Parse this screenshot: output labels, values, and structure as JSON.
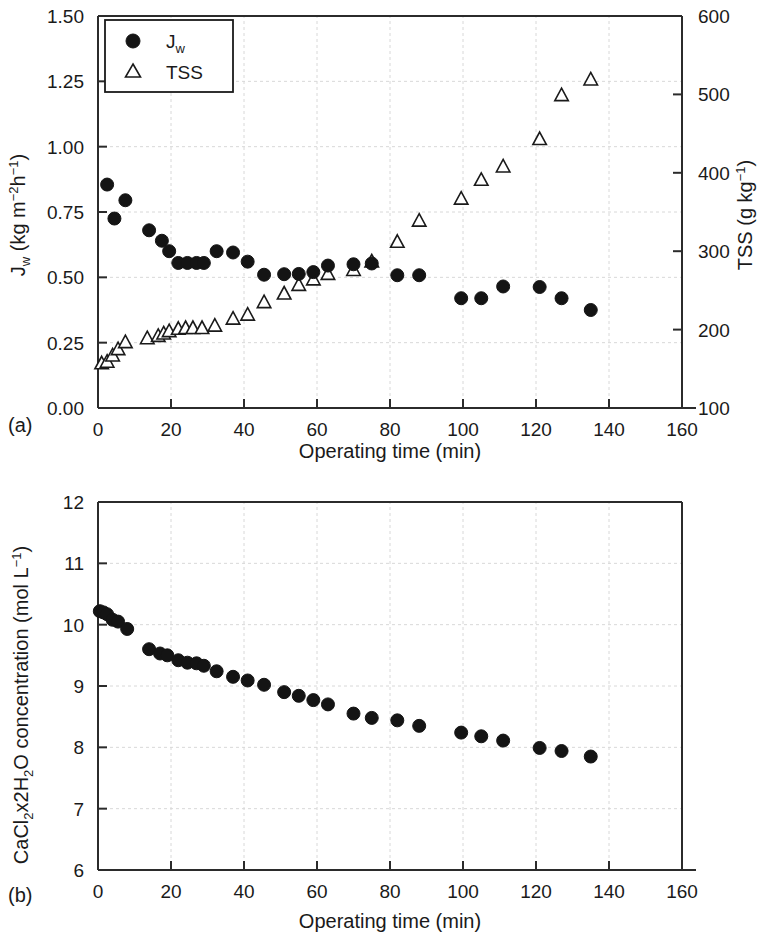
{
  "figure": {
    "panel_a_label": "(a)",
    "panel_b_label": "(b)"
  },
  "chart_data": [
    {
      "id": "panel_a",
      "type": "scatter",
      "title": "",
      "xlabel": "Operating time (min)",
      "ylabel": "J_w (kg m^-2 h^-1)",
      "ylabel_parts": {
        "prefix": "J",
        "sub": "w",
        "unit_open": " (kg m",
        "unit_sup1": "-2",
        "unit_mid": "h",
        "unit_sup2": "-1",
        "unit_close": ")"
      },
      "y2label": "TSS (g kg^-1)",
      "y2label_parts": {
        "prefix": "TSS (g kg",
        "sup": "-1",
        "close": ")"
      },
      "xlim": [
        0,
        160
      ],
      "ylim": [
        0.0,
        1.5
      ],
      "y2lim": [
        100,
        600
      ],
      "xticks": [
        0,
        20,
        40,
        60,
        80,
        100,
        120,
        140,
        160
      ],
      "xtick_labels": [
        "0",
        "20",
        "40",
        "60",
        "80",
        "100",
        "120",
        "140",
        "160"
      ],
      "yticks": [
        0.0,
        0.25,
        0.5,
        0.75,
        1.0,
        1.25,
        1.5
      ],
      "ytick_labels": [
        "0.00",
        "0.25",
        "0.50",
        "0.75",
        "1.00",
        "1.25",
        "1.50"
      ],
      "y2ticks": [
        100,
        200,
        300,
        400,
        500,
        600
      ],
      "y2tick_labels": [
        "100",
        "200",
        "300",
        "400",
        "500",
        "600"
      ],
      "grid": true,
      "legend_position": "top-left",
      "series": [
        {
          "name": "Jw",
          "label_prefix": "J",
          "label_sub": "w",
          "marker": "filled-circle",
          "color": "#141414",
          "axis": "left",
          "x": [
            2.5,
            4.5,
            7.5,
            14.0,
            17.5,
            19.5,
            22.0,
            24.5,
            27.0,
            29.0,
            32.5,
            37.0,
            41.0,
            45.5,
            51.0,
            55.0,
            59.0,
            63.0,
            70.0,
            75.0,
            82.0,
            88.0,
            99.5,
            105.0,
            111.0,
            121.0,
            127.0,
            135.0
          ],
          "y": [
            0.855,
            0.725,
            0.795,
            0.68,
            0.64,
            0.6,
            0.555,
            0.555,
            0.555,
            0.555,
            0.6,
            0.595,
            0.56,
            0.51,
            0.512,
            0.513,
            0.52,
            0.545,
            0.55,
            0.553,
            0.508,
            0.508,
            0.42,
            0.42,
            0.465,
            0.463,
            0.42,
            0.375
          ]
        },
        {
          "name": "TSS",
          "label": "TSS",
          "marker": "open-triangle",
          "color": "#1a1a1a",
          "axis": "right",
          "x": [
            1.0,
            2.5,
            4.0,
            5.5,
            7.5,
            13.5,
            16.5,
            18.0,
            19.5,
            22.0,
            24.0,
            26.0,
            28.5,
            32.0,
            37.0,
            41.0,
            45.5,
            51.0,
            55.0,
            59.0,
            63.0,
            70.0,
            75.0,
            82.0,
            88.0,
            99.5,
            105.0,
            111.0,
            121.0,
            127.0,
            135.0
          ],
          "y": [
            158,
            160,
            168,
            176,
            185,
            190,
            193,
            196,
            199,
            202,
            203,
            203,
            203,
            206,
            215,
            220,
            236,
            247,
            258,
            265,
            272,
            277,
            288,
            313,
            340,
            368,
            392,
            409,
            444,
            500,
            520
          ]
        }
      ]
    },
    {
      "id": "panel_b",
      "type": "scatter",
      "title": "",
      "xlabel": "Operating time (min)",
      "ylabel": "CaCl2x2H2O concentration (mol L^-1)",
      "ylabel_parts": {
        "p1": "CaCl",
        "sub1": "2",
        "p2": "x2H",
        "sub2": "2",
        "p3": "O concentration (mol L",
        "sup1": "-1",
        "p4": ")"
      },
      "xlim": [
        0,
        160
      ],
      "ylim": [
        6,
        12
      ],
      "xticks": [
        0,
        20,
        40,
        60,
        80,
        100,
        120,
        140,
        160
      ],
      "xtick_labels": [
        "0",
        "20",
        "40",
        "60",
        "80",
        "100",
        "120",
        "140",
        "160"
      ],
      "yticks": [
        6,
        7,
        8,
        9,
        10,
        11,
        12
      ],
      "ytick_labels": [
        "6",
        "7",
        "8",
        "9",
        "10",
        "11",
        "12"
      ],
      "grid": true,
      "series": [
        {
          "name": "CaCl2x2H2O concentration",
          "marker": "filled-circle",
          "color": "#141414",
          "axis": "left",
          "x": [
            0.5,
            1.5,
            2.5,
            4.0,
            5.5,
            8.0,
            14.0,
            17.0,
            19.0,
            22.0,
            24.5,
            27.0,
            29.0,
            32.5,
            37.0,
            41.0,
            45.5,
            51.0,
            55.0,
            59.0,
            63.0,
            70.0,
            75.0,
            82.0,
            88.0,
            99.5,
            105.0,
            111.0,
            121.0,
            127.0,
            135.0
          ],
          "y": [
            10.22,
            10.2,
            10.17,
            10.08,
            10.05,
            9.93,
            9.6,
            9.53,
            9.5,
            9.42,
            9.38,
            9.37,
            9.33,
            9.24,
            9.15,
            9.09,
            9.02,
            8.9,
            8.84,
            8.77,
            8.7,
            8.55,
            8.48,
            8.44,
            8.35,
            8.24,
            8.18,
            8.11,
            7.99,
            7.94,
            7.85
          ]
        }
      ]
    }
  ]
}
